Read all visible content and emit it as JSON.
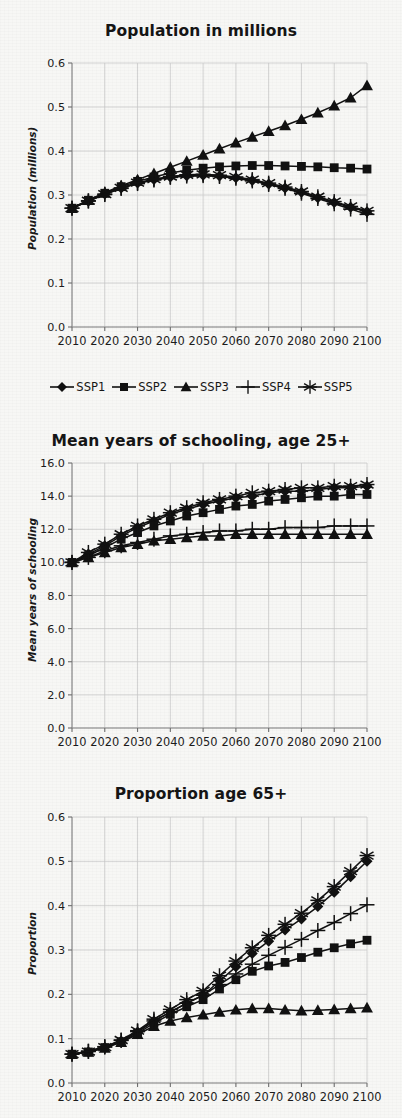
{
  "figure": {
    "background_color": "#f7f7f5",
    "ink_color": "#111111",
    "grid_color": "#c9c9c9"
  },
  "legend": {
    "position": "below-first-chart",
    "items": [
      {
        "label": "SSP1",
        "marker": "diamond-marker"
      },
      {
        "label": "SSP2",
        "marker": "square-marker"
      },
      {
        "label": "SSP3",
        "marker": "triangle-marker"
      },
      {
        "label": "SSP4",
        "marker": "plus-marker"
      },
      {
        "label": "SSP5",
        "marker": "asterisk-marker"
      }
    ]
  },
  "chart_data": [
    {
      "type": "line",
      "title": "Population in millions",
      "xlabel": "",
      "ylabel": "Population (millions)",
      "xlim": [
        2010,
        2100
      ],
      "ylim": [
        0.0,
        0.6
      ],
      "ytick_labels": [
        "0.0",
        "0.1",
        "0.2",
        "0.3",
        "0.4",
        "0.5",
        "0.6"
      ],
      "ytick_values": [
        0.0,
        0.1,
        0.2,
        0.3,
        0.4,
        0.5,
        0.6
      ],
      "xtick_labels": [
        "2010",
        "2020",
        "2030",
        "2040",
        "2050",
        "2060",
        "2070",
        "2080",
        "2090",
        "2100"
      ],
      "xtick_values": [
        2010,
        2020,
        2030,
        2040,
        2050,
        2060,
        2070,
        2080,
        2090,
        2100
      ],
      "grid": true,
      "x": [
        2010,
        2015,
        2020,
        2025,
        2030,
        2035,
        2040,
        2045,
        2050,
        2055,
        2060,
        2065,
        2070,
        2075,
        2080,
        2085,
        2090,
        2095,
        2100
      ],
      "series": [
        {
          "name": "SSP1",
          "marker": "diamond-marker",
          "values": [
            0.27,
            0.286,
            0.302,
            0.316,
            0.327,
            0.335,
            0.341,
            0.344,
            0.345,
            0.343,
            0.339,
            0.333,
            0.325,
            0.316,
            0.306,
            0.294,
            0.283,
            0.272,
            0.262
          ]
        },
        {
          "name": "SSP2",
          "marker": "square-marker",
          "values": [
            0.27,
            0.288,
            0.304,
            0.319,
            0.331,
            0.341,
            0.35,
            0.356,
            0.361,
            0.364,
            0.366,
            0.367,
            0.367,
            0.366,
            0.365,
            0.364,
            0.362,
            0.361,
            0.359
          ]
        },
        {
          "name": "SSP3",
          "marker": "triangle-marker",
          "values": [
            0.27,
            0.288,
            0.305,
            0.321,
            0.335,
            0.349,
            0.363,
            0.377,
            0.391,
            0.405,
            0.419,
            0.432,
            0.445,
            0.458,
            0.472,
            0.487,
            0.503,
            0.521,
            0.549
          ]
        },
        {
          "name": "SSP4",
          "marker": "plus-marker",
          "values": [
            0.27,
            0.286,
            0.301,
            0.315,
            0.326,
            0.334,
            0.34,
            0.343,
            0.344,
            0.342,
            0.338,
            0.332,
            0.324,
            0.315,
            0.304,
            0.292,
            0.28,
            0.268,
            0.256
          ]
        },
        {
          "name": "SSP5",
          "marker": "asterisk-marker",
          "values": [
            0.27,
            0.287,
            0.302,
            0.316,
            0.328,
            0.336,
            0.342,
            0.346,
            0.347,
            0.345,
            0.341,
            0.335,
            0.327,
            0.318,
            0.308,
            0.296,
            0.285,
            0.274,
            0.264
          ]
        }
      ]
    },
    {
      "type": "line",
      "title": "Mean years of schooling, age 25+",
      "xlabel": "",
      "ylabel": "Mean years of schooling",
      "xlim": [
        2010,
        2100
      ],
      "ylim": [
        0.0,
        16.0
      ],
      "ytick_labels": [
        "0.0",
        "2.0",
        "4.0",
        "6.0",
        "8.0",
        "10.0",
        "12.0",
        "14.0",
        "16.0"
      ],
      "ytick_values": [
        0.0,
        2.0,
        4.0,
        6.0,
        8.0,
        10.0,
        12.0,
        14.0,
        16.0
      ],
      "xtick_labels": [
        "2010",
        "2020",
        "2030",
        "2040",
        "2050",
        "2060",
        "2070",
        "2080",
        "2090",
        "2100"
      ],
      "xtick_values": [
        2010,
        2020,
        2030,
        2040,
        2050,
        2060,
        2070,
        2080,
        2090,
        2100
      ],
      "grid": true,
      "x": [
        2010,
        2015,
        2020,
        2025,
        2030,
        2035,
        2040,
        2045,
        2050,
        2055,
        2060,
        2065,
        2070,
        2075,
        2080,
        2085,
        2090,
        2095,
        2100
      ],
      "series": [
        {
          "name": "SSP1",
          "marker": "diamond-marker",
          "values": [
            10.0,
            10.5,
            11.0,
            11.6,
            12.1,
            12.5,
            12.9,
            13.2,
            13.5,
            13.7,
            13.9,
            14.0,
            14.2,
            14.3,
            14.3,
            14.4,
            14.5,
            14.5,
            14.6
          ]
        },
        {
          "name": "SSP2",
          "marker": "square-marker",
          "values": [
            10.0,
            10.4,
            10.9,
            11.4,
            11.8,
            12.2,
            12.5,
            12.8,
            13.0,
            13.2,
            13.4,
            13.5,
            13.7,
            13.8,
            13.9,
            14.0,
            14.0,
            14.1,
            14.1
          ]
        },
        {
          "name": "SSP3",
          "marker": "triangle-marker",
          "values": [
            10.0,
            10.3,
            10.6,
            10.9,
            11.1,
            11.3,
            11.4,
            11.5,
            11.6,
            11.6,
            11.7,
            11.7,
            11.7,
            11.7,
            11.7,
            11.7,
            11.7,
            11.7,
            11.7
          ]
        },
        {
          "name": "SSP4",
          "marker": "plus-marker",
          "values": [
            10.0,
            10.3,
            10.7,
            11.0,
            11.2,
            11.4,
            11.6,
            11.7,
            11.8,
            11.9,
            11.9,
            12.0,
            12.0,
            12.1,
            12.1,
            12.1,
            12.2,
            12.2,
            12.2
          ]
        },
        {
          "name": "SSP5",
          "marker": "asterisk-marker",
          "values": [
            10.0,
            10.6,
            11.1,
            11.7,
            12.2,
            12.6,
            13.0,
            13.3,
            13.6,
            13.8,
            14.0,
            14.2,
            14.3,
            14.4,
            14.5,
            14.5,
            14.6,
            14.6,
            14.7
          ]
        }
      ]
    },
    {
      "type": "line",
      "title": "Proportion age 65+",
      "xlabel": "",
      "ylabel": "Proportion",
      "xlim": [
        2010,
        2100
      ],
      "ylim": [
        0.0,
        0.6
      ],
      "ytick_labels": [
        "0.0",
        "0.1",
        "0.2",
        "0.3",
        "0.4",
        "0.5",
        "0.6"
      ],
      "ytick_values": [
        0.0,
        0.1,
        0.2,
        0.3,
        0.4,
        0.5,
        0.6
      ],
      "xtick_labels": [
        "2010",
        "2020",
        "2030",
        "2040",
        "2050",
        "2060",
        "2070",
        "2080",
        "2090",
        "2100"
      ],
      "xtick_values": [
        2010,
        2020,
        2030,
        2040,
        2050,
        2060,
        2070,
        2080,
        2090,
        2100
      ],
      "grid": true,
      "x": [
        2010,
        2015,
        2020,
        2025,
        2030,
        2035,
        2040,
        2045,
        2050,
        2055,
        2060,
        2065,
        2070,
        2075,
        2080,
        2085,
        2090,
        2095,
        2100
      ],
      "series": [
        {
          "name": "SSP1",
          "marker": "diamond-marker",
          "values": [
            0.065,
            0.07,
            0.08,
            0.095,
            0.115,
            0.14,
            0.16,
            0.18,
            0.198,
            0.23,
            0.262,
            0.292,
            0.32,
            0.345,
            0.37,
            0.398,
            0.43,
            0.465,
            0.5
          ]
        },
        {
          "name": "SSP2",
          "marker": "square-marker",
          "values": [
            0.065,
            0.07,
            0.08,
            0.093,
            0.112,
            0.135,
            0.155,
            0.172,
            0.188,
            0.212,
            0.233,
            0.252,
            0.264,
            0.272,
            0.283,
            0.295,
            0.305,
            0.314,
            0.322
          ]
        },
        {
          "name": "SSP3",
          "marker": "triangle-marker",
          "values": [
            0.065,
            0.07,
            0.079,
            0.092,
            0.11,
            0.128,
            0.14,
            0.148,
            0.154,
            0.16,
            0.165,
            0.168,
            0.168,
            0.165,
            0.163,
            0.164,
            0.166,
            0.168,
            0.17
          ]
        },
        {
          "name": "SSP4",
          "marker": "plus-marker",
          "values": [
            0.065,
            0.072,
            0.082,
            0.096,
            0.116,
            0.14,
            0.16,
            0.18,
            0.198,
            0.222,
            0.246,
            0.268,
            0.288,
            0.306,
            0.324,
            0.344,
            0.362,
            0.382,
            0.402
          ]
        },
        {
          "name": "SSP5",
          "marker": "asterisk-marker",
          "values": [
            0.065,
            0.071,
            0.081,
            0.097,
            0.118,
            0.144,
            0.166,
            0.188,
            0.208,
            0.242,
            0.275,
            0.305,
            0.333,
            0.358,
            0.383,
            0.412,
            0.443,
            0.478,
            0.513
          ]
        }
      ]
    }
  ]
}
